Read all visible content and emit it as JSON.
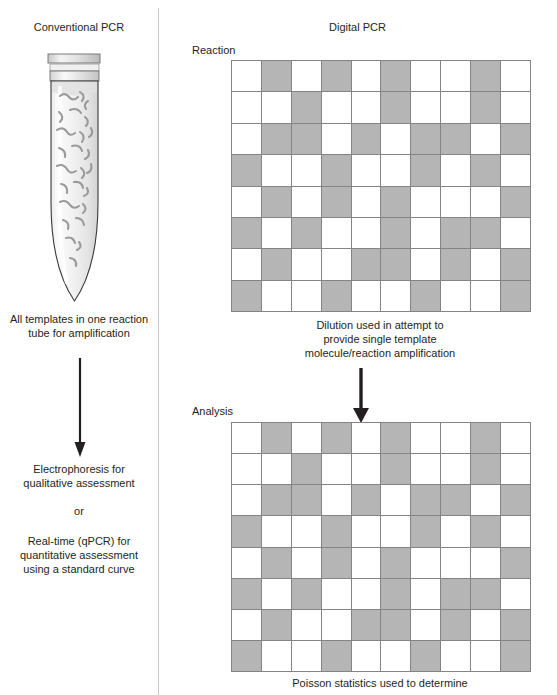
{
  "figure": {
    "title_left": "Conventional PCR",
    "title_right": "Digital PCR",
    "accent_gray": "#b5b5b5",
    "grid_line_color": "#848484",
    "divider_color": "#c9c9cc",
    "text_color": "#231f20"
  },
  "left_panel": {
    "header": "Conventional PCR",
    "tube_caption": "All templates in one reaction\ntube for amplification",
    "arrow_name": "down-arrow",
    "result_primary": "Electrophoresis for\nqualitative assessment",
    "result_or": "or",
    "result_secondary": "Real-time (qPCR) for\nquantitative assessment\nusing a standard curve",
    "tube": {
      "name": "microcentrifuge-tube",
      "template_count": 25
    }
  },
  "right_panel": {
    "header": "Digital PCR",
    "reaction_label": "Reaction",
    "analysis_label": "Analysis",
    "reaction_caption": "Dilution used in attempt to\nprovide single template\nmolecule/reaction amplification",
    "analysis_caption": "Poisson statistics used to determine",
    "arrow_name": "down-arrow"
  },
  "chart_data": {
    "type": "heatmap",
    "rows": 8,
    "cols": 10,
    "legend": [
      {
        "state": "positive",
        "color": "#b5b5b5",
        "value": 1
      },
      {
        "state": "negative",
        "color": "#ffffff",
        "value": 0
      }
    ],
    "panels": [
      {
        "name": "Reaction",
        "caption": "Dilution used in attempt to provide single template molecule/reaction amplification",
        "values": [
          [
            0,
            1,
            0,
            1,
            0,
            1,
            0,
            0,
            1,
            0
          ],
          [
            0,
            0,
            1,
            0,
            0,
            1,
            0,
            0,
            1,
            0
          ],
          [
            0,
            1,
            1,
            0,
            1,
            0,
            1,
            1,
            0,
            1
          ],
          [
            1,
            0,
            0,
            1,
            0,
            0,
            1,
            0,
            1,
            0
          ],
          [
            0,
            1,
            0,
            1,
            0,
            1,
            0,
            0,
            0,
            1
          ],
          [
            1,
            0,
            1,
            0,
            0,
            1,
            0,
            1,
            1,
            0
          ],
          [
            0,
            1,
            0,
            0,
            1,
            1,
            0,
            1,
            0,
            1
          ],
          [
            1,
            0,
            0,
            1,
            0,
            0,
            1,
            0,
            0,
            1
          ]
        ]
      },
      {
        "name": "Analysis",
        "caption": "Poisson statistics used to determine",
        "values": [
          [
            0,
            1,
            0,
            1,
            0,
            1,
            0,
            0,
            1,
            0
          ],
          [
            0,
            0,
            1,
            0,
            0,
            1,
            0,
            0,
            1,
            0
          ],
          [
            0,
            1,
            1,
            0,
            1,
            0,
            1,
            1,
            0,
            1
          ],
          [
            1,
            0,
            0,
            1,
            0,
            0,
            1,
            0,
            1,
            0
          ],
          [
            0,
            1,
            0,
            1,
            0,
            1,
            0,
            0,
            0,
            1
          ],
          [
            1,
            0,
            1,
            0,
            0,
            1,
            0,
            1,
            1,
            0
          ],
          [
            0,
            1,
            0,
            0,
            1,
            1,
            0,
            1,
            0,
            1
          ],
          [
            1,
            0,
            0,
            1,
            0,
            0,
            1,
            0,
            0,
            1
          ]
        ]
      }
    ]
  }
}
